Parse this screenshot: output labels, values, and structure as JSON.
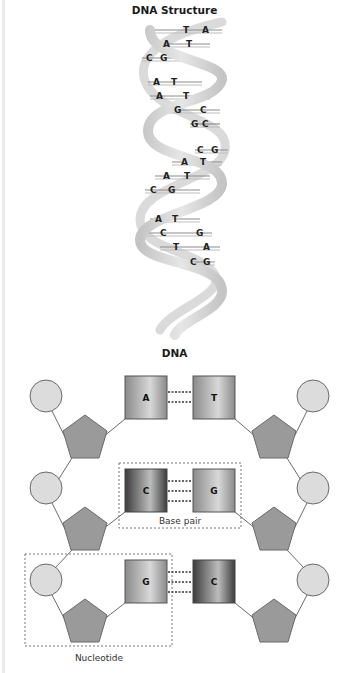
{
  "helix": {
    "title": "DNA Structure",
    "base_pairs": [
      {
        "left": "T",
        "right": "A"
      },
      {
        "left": "A",
        "right": "T"
      },
      {
        "left": "C",
        "right": "G"
      },
      {
        "left": "A",
        "right": "T"
      },
      {
        "left": "A",
        "right": "T"
      },
      {
        "left": "G",
        "right": "C"
      },
      {
        "left": "G",
        "right": "C"
      },
      {
        "left": "C",
        "right": "G"
      },
      {
        "left": "A",
        "right": "T"
      },
      {
        "left": "A",
        "right": "T"
      },
      {
        "left": "C",
        "right": "G"
      },
      {
        "left": "A",
        "right": "T"
      },
      {
        "left": "C",
        "right": "G"
      },
      {
        "left": "T",
        "right": "A"
      },
      {
        "left": "C",
        "right": "G"
      }
    ]
  },
  "schematic": {
    "title": "DNA",
    "rows": [
      {
        "left_base": "A",
        "right_base": "T",
        "bonds": 2
      },
      {
        "left_base": "C",
        "right_base": "G",
        "bonds": 3
      },
      {
        "left_base": "G",
        "right_base": "C",
        "bonds": 3
      }
    ],
    "labels": {
      "base_pair": "Base pair",
      "nucleotide": "Nucleotide"
    }
  },
  "colors": {
    "phosphate_fill": "#dcdcdc",
    "sugar_fill": "#9a9a9a",
    "stroke": "#6a6a6a",
    "ribbon": "#d2d2d2",
    "rung": "#8c8c8c",
    "base_light": "#a8a8a8",
    "base_dark": "#4a4a4a"
  }
}
